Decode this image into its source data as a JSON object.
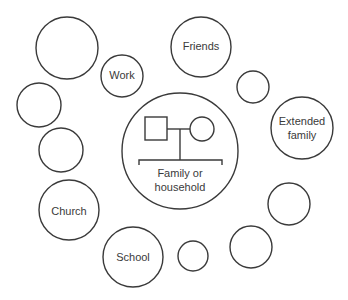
{
  "diagram": {
    "type": "ecomap",
    "stroke_color": "#3a3a3a",
    "background": "#ffffff",
    "center": {
      "label_line1": "Family or",
      "label_line2": "household",
      "genogram": {
        "male_symbol": "square",
        "female_symbol": "circle",
        "connector": "marriage-line-with-descent-bracket"
      }
    },
    "nodes": [
      {
        "id": "top-left-large",
        "label": ""
      },
      {
        "id": "work",
        "label": "Work"
      },
      {
        "id": "friends",
        "label": "Friends"
      },
      {
        "id": "small-right-top",
        "label": ""
      },
      {
        "id": "extended-family",
        "label_line1": "Extended",
        "label_line2": "family"
      },
      {
        "id": "left-upper",
        "label": ""
      },
      {
        "id": "left-middle",
        "label": ""
      },
      {
        "id": "church",
        "label": "Church"
      },
      {
        "id": "school",
        "label": "School"
      },
      {
        "id": "bottom-small",
        "label": ""
      },
      {
        "id": "bottom-right-mid",
        "label": ""
      },
      {
        "id": "right-lower",
        "label": ""
      }
    ]
  }
}
